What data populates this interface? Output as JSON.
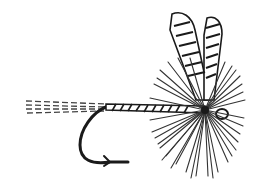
{
  "illustration": {
    "subject": "fishing fly",
    "style": "black and white engraving",
    "parts": [
      "tail",
      "hook",
      "body",
      "hackle",
      "wings"
    ],
    "colors": {
      "ink": "#1a1a1a",
      "background": "#ffffff",
      "gray": "#555555"
    }
  }
}
